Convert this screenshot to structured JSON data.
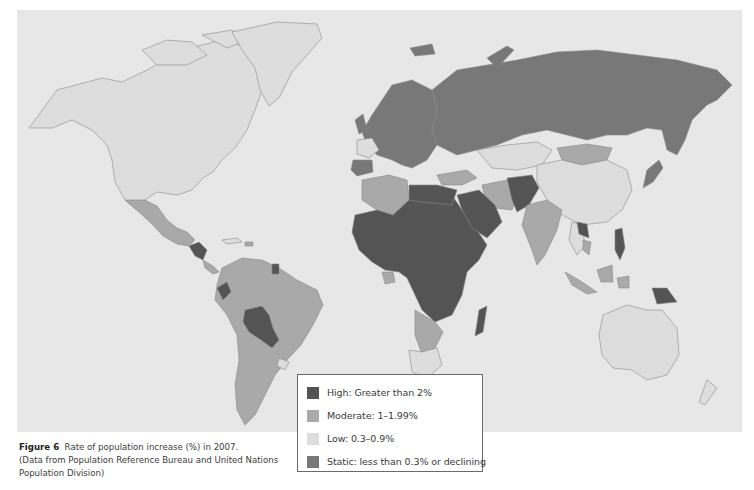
{
  "figure": {
    "label": "Figure 6",
    "caption_title": "Rate of population increase (%) in 2007.",
    "caption_source": "(Data from Population Reference Bureau and United Nations Population Division)"
  },
  "legend": {
    "items": [
      {
        "key": "high",
        "label": "High: Greater than 2%",
        "color": "#545454"
      },
      {
        "key": "moderate",
        "label": "Moderate: 1–1.99%",
        "color": "#a9a9a9"
      },
      {
        "key": "low",
        "label": "Low: 0.3–0.9%",
        "color": "#dddddd"
      },
      {
        "key": "static",
        "label": "Static: less than 0.3% or declining",
        "color": "#787878"
      }
    ]
  },
  "colors": {
    "ocean": "#e7e7e7",
    "border": "#8a8a8a",
    "high": "#545454",
    "moderate": "#a9a9a9",
    "low": "#dddddd",
    "static": "#787878"
  },
  "map": {
    "type": "choropleth",
    "title": "Rate of population increase (%) in 2007",
    "regions": [
      {
        "name": "Canada",
        "class": "low"
      },
      {
        "name": "United States",
        "class": "low"
      },
      {
        "name": "Greenland",
        "class": "low"
      },
      {
        "name": "Mexico",
        "class": "moderate"
      },
      {
        "name": "Guatemala / Honduras",
        "class": "high"
      },
      {
        "name": "South America (most)",
        "class": "moderate"
      },
      {
        "name": "Bolivia / Paraguay",
        "class": "high"
      },
      {
        "name": "Ecuador",
        "class": "high"
      },
      {
        "name": "French Guiana",
        "class": "high"
      },
      {
        "name": "Uruguay",
        "class": "low"
      },
      {
        "name": "Russia",
        "class": "static"
      },
      {
        "name": "Europe (most)",
        "class": "static"
      },
      {
        "name": "Spain",
        "class": "static"
      },
      {
        "name": "France",
        "class": "low"
      },
      {
        "name": "Kazakhstan",
        "class": "low"
      },
      {
        "name": "Mongolia",
        "class": "moderate"
      },
      {
        "name": "China",
        "class": "low"
      },
      {
        "name": "Japan",
        "class": "static"
      },
      {
        "name": "Turkey / Iran",
        "class": "moderate"
      },
      {
        "name": "Saudi Arabia / Iraq",
        "class": "high"
      },
      {
        "name": "Afghanistan / Pakistan",
        "class": "high"
      },
      {
        "name": "India",
        "class": "moderate"
      },
      {
        "name": "Laos",
        "class": "high"
      },
      {
        "name": "Philippines",
        "class": "high"
      },
      {
        "name": "Indonesia",
        "class": "moderate"
      },
      {
        "name": "Papua New Guinea",
        "class": "high"
      },
      {
        "name": "Australia",
        "class": "low"
      },
      {
        "name": "New Zealand",
        "class": "low"
      },
      {
        "name": "Algeria / Morocco",
        "class": "moderate"
      },
      {
        "name": "Sub-Saharan Africa (most)",
        "class": "high"
      },
      {
        "name": "Southern Africa",
        "class": "moderate"
      },
      {
        "name": "South Africa",
        "class": "low"
      },
      {
        "name": "Madagascar",
        "class": "high"
      }
    ]
  }
}
